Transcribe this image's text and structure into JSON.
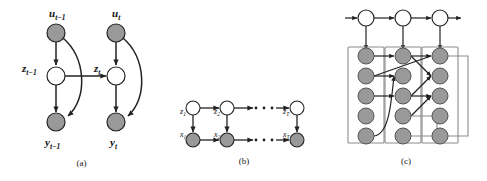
{
  "figure": {
    "background_color": "#ffffff",
    "shaded_node_color": "#999999",
    "open_node_color": "#ffffff",
    "node_stroke_color": "#222222",
    "edge_color": "#222222",
    "plate_stroke_color": "#888888"
  },
  "panels": [
    {
      "id": "a",
      "caption": "(a)",
      "description": "state space model with control inputs over two time slices",
      "nodes": [
        {
          "name": "u-prev",
          "label": "u",
          "subscript": "t−1",
          "shaded": true,
          "cx": 56,
          "cy": 33
        },
        {
          "name": "u-curr",
          "label": "u",
          "subscript": "t",
          "shaded": true,
          "cx": 116,
          "cy": 33
        },
        {
          "name": "z-prev",
          "label": "z",
          "subscript": "t−1",
          "shaded": false,
          "cx": 56,
          "cy": 76
        },
        {
          "name": "z-curr",
          "label": "z",
          "subscript": "t",
          "shaded": false,
          "cx": 116,
          "cy": 76
        },
        {
          "name": "y-prev",
          "label": "y",
          "subscript": "t−1",
          "shaded": true,
          "cx": 56,
          "cy": 122
        },
        {
          "name": "y-curr",
          "label": "y",
          "subscript": "t",
          "shaded": true,
          "cx": 116,
          "cy": 122
        }
      ],
      "edges": [
        {
          "from": "u-prev",
          "to": "z-prev",
          "curved": false
        },
        {
          "from": "u-curr",
          "to": "z-curr",
          "curved": false
        },
        {
          "from": "z-prev",
          "to": "y-prev",
          "curved": false
        },
        {
          "from": "z-curr",
          "to": "y-curr",
          "curved": false
        },
        {
          "from": "z-prev",
          "to": "z-curr",
          "curved": false
        },
        {
          "from": "u-prev",
          "to": "y-prev",
          "curved": true
        },
        {
          "from": "u-curr",
          "to": "y-curr",
          "curved": true
        }
      ]
    },
    {
      "id": "b",
      "caption": "(b)",
      "description": "chain graph of latent z nodes over observed x nodes with ellipsis",
      "nodes": [
        {
          "name": "z-1",
          "label": "z",
          "subscript": "1",
          "shaded": false,
          "cx": 30,
          "cy": 108
        },
        {
          "name": "z-2",
          "label": "z",
          "subscript": "2",
          "shaded": false,
          "cx": 64,
          "cy": 108
        },
        {
          "name": "z-T",
          "label": "z",
          "subscript": "T",
          "shaded": false,
          "cx": 134,
          "cy": 108
        },
        {
          "name": "x-1",
          "label": "x",
          "subscript": "1",
          "shaded": true,
          "cx": 30,
          "cy": 140
        },
        {
          "name": "x-2",
          "label": "x",
          "subscript": "2",
          "shaded": true,
          "cx": 64,
          "cy": 140
        },
        {
          "name": "x-T",
          "label": "x",
          "subscript": "T",
          "shaded": true,
          "cx": 134,
          "cy": 140
        }
      ],
      "ellipsis_rows": 2,
      "ellipsis_dots": 3
    },
    {
      "id": "c",
      "caption": "(c)",
      "description": "three time slices of plated shaded nodes with a top chain of open nodes and cross connections",
      "top_nodes": [
        {
          "name": "top-1",
          "shaded": false,
          "cx": 41,
          "cy": 18
        },
        {
          "name": "top-2",
          "shaded": false,
          "cx": 78,
          "cy": 18
        },
        {
          "name": "top-3",
          "shaded": false,
          "cx": 115,
          "cy": 18
        }
      ],
      "plates": [
        {
          "name": "plate-1",
          "x": 23,
          "y": 47,
          "w": 36,
          "h": 96
        },
        {
          "name": "plate-2",
          "x": 60,
          "y": 47,
          "w": 36,
          "h": 96
        },
        {
          "name": "plate-3",
          "x": 97,
          "y": 47,
          "w": 36,
          "h": 96
        }
      ],
      "column_rows": 5,
      "column_node_color": "#999999"
    }
  ]
}
